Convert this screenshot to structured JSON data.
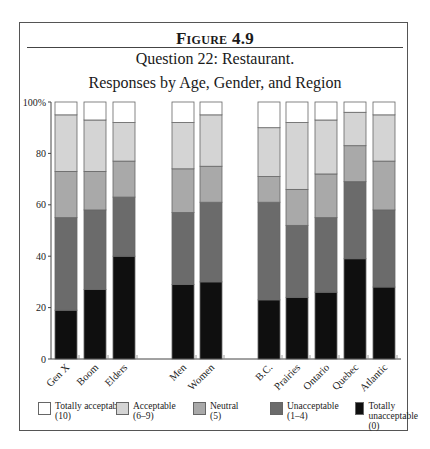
{
  "figure": {
    "label": "Figure 4.9",
    "subtitle_line1": "Question 22: Restaurant.",
    "subtitle_line2": "Responses by Age, Gender, and Region"
  },
  "legend": [
    {
      "label": "Totally acceptable",
      "sub": "(10)",
      "color": "#ffffff"
    },
    {
      "label": "Acceptable",
      "sub": "(6–9)",
      "color": "#d4d4d4"
    },
    {
      "label": "Neutral",
      "sub": "(5)",
      "color": "#a9a9a9"
    },
    {
      "label": "Unacceptable",
      "sub": "(1–4)",
      "color": "#6b6b6b"
    },
    {
      "label": "Totally unacceptable",
      "sub": "(0)",
      "color": "#0f0f0f"
    }
  ],
  "chart_data": {
    "type": "bar",
    "stacked": true,
    "percent": true,
    "xlabel": "",
    "ylabel": "",
    "ylim": [
      0,
      100
    ],
    "yticks": [
      "0",
      "20",
      "40",
      "60",
      "80",
      "100%"
    ],
    "groups": [
      {
        "name": "Age",
        "categories": [
          "Gen X",
          "Boom",
          "Elders"
        ]
      },
      {
        "name": "Gender",
        "categories": [
          "Men",
          "Women"
        ]
      },
      {
        "name": "Region",
        "categories": [
          "B.C.",
          "Prairies",
          "Ontario",
          "Quebec",
          "Atlantic"
        ]
      }
    ],
    "categories": [
      "Gen X",
      "Boom",
      "Elders",
      "Men",
      "Women",
      "B.C.",
      "Prairies",
      "Ontario",
      "Quebec",
      "Atlantic"
    ],
    "series": [
      {
        "name": "Totally unacceptable (0)",
        "color": "#0f0f0f",
        "values": [
          19,
          27,
          40,
          29,
          30,
          23,
          24,
          26,
          39,
          28
        ]
      },
      {
        "name": "Unacceptable (1–4)",
        "color": "#6b6b6b",
        "values": [
          36,
          31,
          23,
          28,
          31,
          38,
          28,
          29,
          30,
          30
        ]
      },
      {
        "name": "Neutral (5)",
        "color": "#a9a9a9",
        "values": [
          18,
          15,
          14,
          17,
          14,
          10,
          14,
          17,
          14,
          19
        ]
      },
      {
        "name": "Acceptable (6–9)",
        "color": "#d4d4d4",
        "values": [
          22,
          20,
          15,
          18,
          20,
          19,
          26,
          21,
          13,
          18
        ]
      },
      {
        "name": "Totally acceptable (10)",
        "color": "#ffffff",
        "values": [
          5,
          7,
          8,
          8,
          5,
          10,
          8,
          7,
          4,
          5
        ]
      }
    ],
    "grid": false,
    "legend_position": "bottom"
  }
}
